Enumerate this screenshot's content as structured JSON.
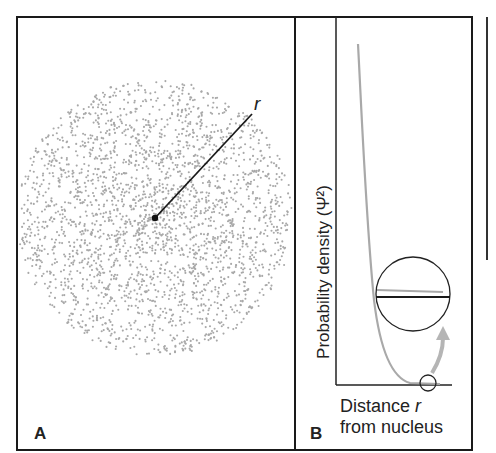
{
  "panels": {
    "a": {
      "letter": "A",
      "radius_label": "r",
      "description": "electron cloud dot density around nucleus"
    },
    "b": {
      "letter": "B",
      "y_axis_label": "Probability density (Ψ²)",
      "x_axis_label_line1": "Distance ",
      "x_axis_label_var": "r",
      "x_axis_label_line2": "from nucleus"
    }
  },
  "colors": {
    "frame": "#1a1a1a",
    "dots": "#a8a8a8",
    "curve": "#a9a9a9",
    "axis": "#222222"
  },
  "chart_data": {
    "type": "line",
    "title": "",
    "xlabel": "Distance r from nucleus",
    "ylabel": "Probability density (Ψ²)",
    "series": [
      {
        "name": "Ψ²",
        "shape": "exponential decay approaching zero asymptotically",
        "x": [
          0.0,
          0.1,
          0.2,
          0.3,
          0.4,
          0.5,
          0.6,
          0.7,
          0.8,
          1.0
        ],
        "values": [
          1.0,
          0.62,
          0.38,
          0.22,
          0.12,
          0.06,
          0.03,
          0.015,
          0.007,
          0.002
        ]
      }
    ],
    "annotations": [
      "magnified inset showing curve approaches but never reaches zero"
    ],
    "grid": false
  }
}
